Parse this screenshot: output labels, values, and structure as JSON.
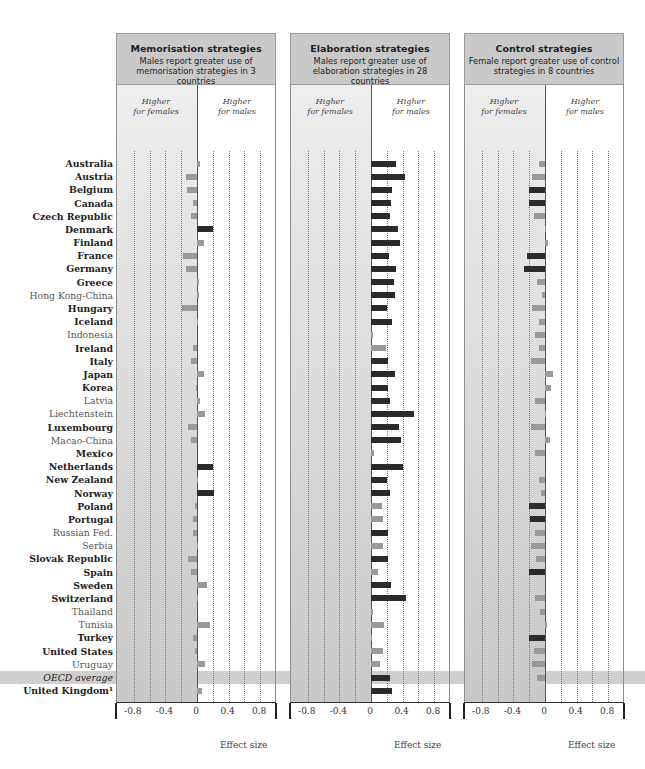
{
  "chart_data": [
    {
      "type": "bar",
      "orientation": "horizontal",
      "title": "Memorisation strategies",
      "subtitle": "Males report greater use of memorisation strategies in 3 countries",
      "xlabel": "Effect size",
      "left_label": "Higher for females",
      "right_label": "Higher for males",
      "xlim": [
        -1.0,
        1.0
      ],
      "xticks": [
        -0.8,
        -0.4,
        0,
        0.4,
        0.8
      ],
      "grid": true,
      "categories": [
        "Australia",
        "Austria",
        "Belgium",
        "Canada",
        "Czech Republic",
        "Denmark",
        "Finland",
        "France",
        "Germany",
        "Greece",
        "Hong Kong-China",
        "Hungary",
        "Iceland",
        "Indonesia",
        "Ireland",
        "Italy",
        "Japan",
        "Korea",
        "Latvia",
        "Liechtenstein",
        "Luxembourg",
        "Macao-China",
        "Mexico",
        "Netherlands",
        "New Zealand",
        "Norway",
        "Poland",
        "Portugal",
        "Russian Fed.",
        "Serbia",
        "Slovak Republic",
        "Spain",
        "Sweden",
        "Switzerland",
        "Thailand",
        "Tunisia",
        "Turkey",
        "United States",
        "Uruguay",
        "OECD average",
        "United Kingdom"
      ],
      "values": [
        0.04,
        -0.14,
        -0.13,
        -0.05,
        -0.08,
        0.2,
        0.09,
        -0.18,
        -0.14,
        0.02,
        0.02,
        -0.19,
        0.01,
        0.0,
        -0.05,
        -0.08,
        0.09,
        -0.01,
        0.04,
        0.1,
        -0.12,
        -0.07,
        0.0,
        0.2,
        0.01,
        0.22,
        -0.03,
        -0.05,
        -0.05,
        0.01,
        -0.12,
        -0.08,
        0.13,
        0.01,
        0.0,
        0.16,
        -0.05,
        -0.03,
        0.1,
        0.0,
        0.06
      ],
      "significant": [
        false,
        false,
        false,
        false,
        false,
        true,
        false,
        false,
        false,
        false,
        false,
        false,
        false,
        false,
        false,
        false,
        false,
        false,
        false,
        false,
        false,
        false,
        false,
        true,
        false,
        true,
        false,
        false,
        false,
        false,
        false,
        false,
        false,
        false,
        false,
        false,
        false,
        false,
        false,
        false,
        false
      ]
    },
    {
      "type": "bar",
      "orientation": "horizontal",
      "title": "Elaboration strategies",
      "subtitle": "Males report greater use of elaboration strategies in 28 countries",
      "xlabel": "Effect size",
      "left_label": "Higher for females",
      "right_label": "Higher for males",
      "xlim": [
        -1.0,
        1.0
      ],
      "xticks": [
        -0.8,
        -0.4,
        0,
        0.4,
        0.8
      ],
      "grid": true,
      "categories": [
        "Australia",
        "Austria",
        "Belgium",
        "Canada",
        "Czech Republic",
        "Denmark",
        "Finland",
        "France",
        "Germany",
        "Greece",
        "Hong Kong-China",
        "Hungary",
        "Iceland",
        "Indonesia",
        "Ireland",
        "Italy",
        "Japan",
        "Korea",
        "Latvia",
        "Liechtenstein",
        "Luxembourg",
        "Macao-China",
        "Mexico",
        "Netherlands",
        "New Zealand",
        "Norway",
        "Poland",
        "Portugal",
        "Russian Fed.",
        "Serbia",
        "Slovak Republic",
        "Spain",
        "Sweden",
        "Switzerland",
        "Thailand",
        "Tunisia",
        "Turkey",
        "United States",
        "Uruguay",
        "OECD average",
        "United Kingdom"
      ],
      "values": [
        0.32,
        0.43,
        0.27,
        0.25,
        0.24,
        0.34,
        0.37,
        0.23,
        0.32,
        0.29,
        0.31,
        0.2,
        0.27,
        0.02,
        0.19,
        0.22,
        0.3,
        0.21,
        0.24,
        0.54,
        0.36,
        0.38,
        0.04,
        0.4,
        0.2,
        0.24,
        0.14,
        0.15,
        0.22,
        0.15,
        0.22,
        0.09,
        0.25,
        0.44,
        0.02,
        0.16,
        0.01,
        0.15,
        0.11,
        0.24,
        0.26
      ],
      "significant": [
        true,
        true,
        true,
        true,
        true,
        true,
        true,
        true,
        true,
        true,
        true,
        true,
        true,
        false,
        false,
        true,
        true,
        true,
        true,
        true,
        true,
        true,
        false,
        true,
        true,
        true,
        false,
        false,
        true,
        false,
        true,
        false,
        true,
        true,
        false,
        false,
        false,
        false,
        false,
        true,
        true
      ]
    },
    {
      "type": "bar",
      "orientation": "horizontal",
      "title": "Control strategies",
      "subtitle": "Female report greater use of control strategies in 8 countries",
      "xlabel": "Effect size",
      "left_label": "Higher for females",
      "right_label": "Higher for males",
      "xlim": [
        -1.0,
        1.0
      ],
      "xticks": [
        -0.8,
        -0.4,
        0,
        0.4,
        0.8
      ],
      "grid": true,
      "categories": [
        "Australia",
        "Austria",
        "Belgium",
        "Canada",
        "Czech Republic",
        "Denmark",
        "Finland",
        "France",
        "Germany",
        "Greece",
        "Hong Kong-China",
        "Hungary",
        "Iceland",
        "Indonesia",
        "Ireland",
        "Italy",
        "Japan",
        "Korea",
        "Latvia",
        "Liechtenstein",
        "Luxembourg",
        "Macao-China",
        "Mexico",
        "Netherlands",
        "New Zealand",
        "Norway",
        "Poland",
        "Portugal",
        "Russian Fed.",
        "Serbia",
        "Slovak Republic",
        "Spain",
        "Sweden",
        "Switzerland",
        "Thailand",
        "Tunisia",
        "Turkey",
        "United States",
        "Uruguay",
        "OECD average",
        "United Kingdom"
      ],
      "values": [
        -0.07,
        -0.17,
        -0.2,
        -0.2,
        -0.14,
        0.01,
        0.04,
        -0.23,
        -0.27,
        -0.1,
        -0.04,
        -0.17,
        -0.07,
        -0.13,
        -0.07,
        -0.18,
        0.1,
        0.08,
        -0.13,
        0.01,
        -0.18,
        0.06,
        -0.13,
        0.0,
        -0.08,
        -0.05,
        -0.2,
        -0.19,
        -0.13,
        -0.18,
        -0.11,
        -0.2,
        0.0,
        -0.13,
        -0.06,
        0.03,
        -0.2,
        -0.14,
        -0.16,
        -0.1,
        0.0
      ],
      "significant": [
        false,
        false,
        true,
        true,
        false,
        false,
        false,
        true,
        true,
        false,
        false,
        false,
        false,
        false,
        false,
        false,
        false,
        false,
        false,
        false,
        false,
        false,
        false,
        false,
        false,
        false,
        true,
        true,
        false,
        false,
        false,
        true,
        false,
        false,
        false,
        false,
        true,
        false,
        false,
        false,
        false
      ]
    }
  ],
  "countries": [
    {
      "name": "Australia",
      "style": "b"
    },
    {
      "name": "Austria",
      "style": "b"
    },
    {
      "name": "Belgium",
      "style": "b"
    },
    {
      "name": "Canada",
      "style": "b"
    },
    {
      "name": "Czech Republic",
      "style": "b"
    },
    {
      "name": "Denmark",
      "style": "b"
    },
    {
      "name": "Finland",
      "style": "b"
    },
    {
      "name": "France",
      "style": "b"
    },
    {
      "name": "Germany",
      "style": "b"
    },
    {
      "name": "Greece",
      "style": "b"
    },
    {
      "name": "Hong Kong-China",
      "style": "n"
    },
    {
      "name": "Hungary",
      "style": "b"
    },
    {
      "name": "Iceland",
      "style": "b"
    },
    {
      "name": "Indonesia",
      "style": "n"
    },
    {
      "name": "Ireland",
      "style": "b"
    },
    {
      "name": "Italy",
      "style": "b"
    },
    {
      "name": "Japan",
      "style": "b"
    },
    {
      "name": "Korea",
      "style": "b"
    },
    {
      "name": "Latvia",
      "style": "n"
    },
    {
      "name": "Liechtenstein",
      "style": "n"
    },
    {
      "name": "Luxembourg",
      "style": "b"
    },
    {
      "name": "Macao-China",
      "style": "n"
    },
    {
      "name": "Mexico",
      "style": "b"
    },
    {
      "name": "Netherlands",
      "style": "b"
    },
    {
      "name": "New Zealand",
      "style": "b"
    },
    {
      "name": "Norway",
      "style": "b"
    },
    {
      "name": "Poland",
      "style": "b"
    },
    {
      "name": "Portugal",
      "style": "b"
    },
    {
      "name": "Russian Fed.",
      "style": "n"
    },
    {
      "name": "Serbia",
      "style": "n"
    },
    {
      "name": "Slovak Republic",
      "style": "b"
    },
    {
      "name": "Spain",
      "style": "b"
    },
    {
      "name": "Sweden",
      "style": "b"
    },
    {
      "name": "Switzerland",
      "style": "b"
    },
    {
      "name": "Thailand",
      "style": "n"
    },
    {
      "name": "Tunisia",
      "style": "n"
    },
    {
      "name": "Turkey",
      "style": "b"
    },
    {
      "name": "United States",
      "style": "b"
    },
    {
      "name": "Uruguay",
      "style": "n"
    },
    {
      "name": "OECD average",
      "style": "i"
    },
    {
      "name": "United Kingdom¹",
      "style": "b"
    }
  ],
  "colors": {
    "significant": "#2b2b2b",
    "not_significant": "#9a9a9a",
    "neg_shade_top": "#eeeeee",
    "neg_shade_bottom": "#c8c8c8",
    "header_bg": "#c9c9c9",
    "oecd_band": "#cfcfcf"
  }
}
